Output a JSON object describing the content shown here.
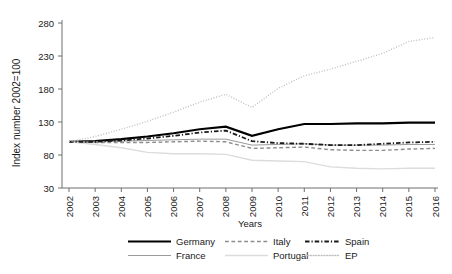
{
  "chart_data": {
    "type": "line",
    "title": "",
    "xlabel": "Years",
    "ylabel": "Index number 2002=100",
    "x": [
      2002,
      2003,
      2004,
      2005,
      2006,
      2007,
      2008,
      2009,
      2010,
      2011,
      2012,
      2013,
      2014,
      2015,
      2016
    ],
    "xtick_labels": [
      "2002",
      "2003",
      "2004",
      "2005",
      "2006",
      "2007",
      "2008",
      "2009",
      "2010",
      "2011",
      "2012",
      "2013",
      "2014",
      "2015",
      "2016"
    ],
    "ytick_labels": [
      "30",
      "80",
      "130",
      "180",
      "230",
      "280"
    ],
    "ytick_values": [
      30,
      80,
      130,
      180,
      230,
      280
    ],
    "ylim": [
      30,
      280
    ],
    "xlim": [
      2002,
      2016
    ],
    "grid": false,
    "legend_position": "bottom",
    "series": [
      {
        "name": "Germany",
        "style": "solid",
        "color": "#000000",
        "width": 2.2,
        "values": [
          100,
          101,
          104,
          108,
          113,
          119,
          123,
          109,
          119,
          127,
          127,
          128,
          128,
          129,
          129
        ]
      },
      {
        "name": "France",
        "style": "solid",
        "color": "#9a9a9a",
        "width": 1.0,
        "values": [
          100,
          100,
          101,
          102,
          103,
          104,
          104,
          95,
          96,
          97,
          95,
          95,
          95,
          96,
          96
        ]
      },
      {
        "name": "Italy",
        "style": "dashed",
        "color": "#8c8c8c",
        "width": 1.4,
        "values": [
          100,
          99,
          99,
          99,
          100,
          101,
          100,
          90,
          91,
          92,
          88,
          87,
          87,
          89,
          90
        ]
      },
      {
        "name": "Portugal",
        "style": "solid",
        "color": "#dcdcdc",
        "width": 1.4,
        "values": [
          100,
          96,
          91,
          84,
          82,
          82,
          81,
          72,
          71,
          70,
          62,
          60,
          59,
          60,
          60
        ]
      },
      {
        "name": "Spain",
        "style": "dash-dot",
        "color": "#1a1a1a",
        "width": 1.8,
        "values": [
          100,
          100,
          102,
          105,
          109,
          114,
          117,
          101,
          98,
          97,
          95,
          95,
          97,
          99,
          100
        ]
      },
      {
        "name": "EP",
        "style": "dotted",
        "color": "#c0c0c0",
        "width": 1.4,
        "values": [
          100,
          108,
          119,
          131,
          145,
          160,
          172,
          152,
          181,
          200,
          210,
          222,
          234,
          252,
          258
        ]
      }
    ]
  },
  "legend": {
    "entries": [
      {
        "label": "Germany"
      },
      {
        "label": "France"
      },
      {
        "label": "Italy"
      },
      {
        "label": "Portugal"
      },
      {
        "label": "Spain"
      },
      {
        "label": "EP"
      }
    ]
  }
}
